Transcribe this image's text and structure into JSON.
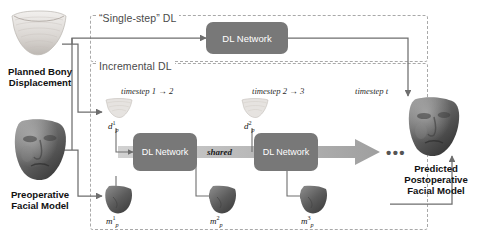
{
  "figure": {
    "type": "pipeline-diagram"
  },
  "regions": {
    "single_step": {
      "label": "“Single-step” DL"
    },
    "incremental": {
      "label": "Incremental DL"
    }
  },
  "networks": {
    "top": {
      "label": "DL Network"
    },
    "step1": {
      "label": "DL Network"
    },
    "step2": {
      "label": "DL Network"
    },
    "shared_label": "shared"
  },
  "inputs": {
    "bony": {
      "caption_line1": "Planned Bony",
      "caption_line2": "Displacement"
    },
    "facial": {
      "caption_line1": "Preoperative",
      "caption_line2": "Facial Model"
    }
  },
  "output": {
    "caption_line1": "Predicted",
    "caption_line2": "Postoperative",
    "caption_line3": "Facial Model"
  },
  "timesteps": [
    {
      "text": "timestep 1 → 2"
    },
    {
      "text": "timestep 2 → 3"
    },
    {
      "text": "timestep t"
    }
  ],
  "variables": [
    {
      "id": "d1",
      "base": "d",
      "sub": "p",
      "sup": "1"
    },
    {
      "id": "m1",
      "base": "m",
      "sub": "p",
      "sup": "1"
    },
    {
      "id": "d2",
      "base": "d",
      "sub": "p",
      "sup": "2"
    },
    {
      "id": "m2",
      "base": "m",
      "sub": "p",
      "sup": "2"
    },
    {
      "id": "m3",
      "base": "m",
      "sub": "p",
      "sup": "3"
    }
  ],
  "ellipsis": "•••",
  "colors": {
    "network_fill": "#787878",
    "network_text": "#ffffff",
    "dashed_border": "#a9a9a9",
    "wire": "#6e6e6e",
    "band_light": "#c9c9c9",
    "band_dark": "#9a9a9a",
    "text": "#111111"
  }
}
